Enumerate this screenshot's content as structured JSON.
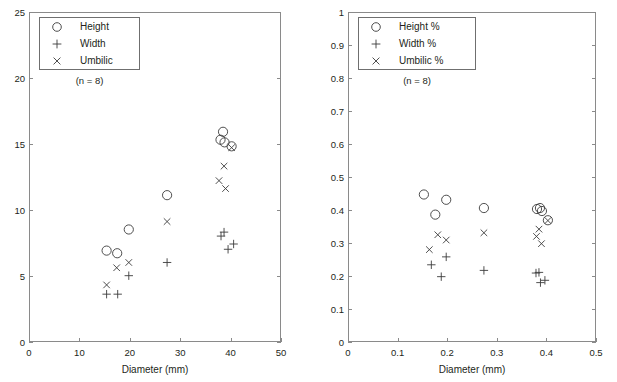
{
  "figure": {
    "background": "#ffffff",
    "axis_color": "#8a8a8a",
    "marker_color": "#3b3b3b",
    "text_color": "#231f20"
  },
  "panels": [
    {
      "id": "absolute",
      "legend": {
        "entries": [
          {
            "symbol": "circle-marker",
            "label": "Height"
          },
          {
            "symbol": "plus-marker",
            "label": "Width"
          },
          {
            "symbol": "cross-marker",
            "label": "Umbilic"
          }
        ],
        "note": "(n = 8)"
      }
    },
    {
      "id": "ratio",
      "legend": {
        "entries": [
          {
            "symbol": "circle-marker",
            "label": "Height %"
          },
          {
            "symbol": "plus-marker",
            "label": "Width %"
          },
          {
            "symbol": "cross-marker",
            "label": "Umbilic %"
          }
        ],
        "note": "(n = 8)"
      }
    }
  ],
  "chart_data": [
    {
      "type": "scatter",
      "title": "",
      "xlabel": "Diameter (mm)",
      "ylabel": "",
      "xlim": [
        0,
        50
      ],
      "ylim": [
        0,
        25
      ],
      "xticks": [
        0,
        10,
        20,
        30,
        40,
        50
      ],
      "yticks": [
        0,
        5,
        10,
        15,
        20,
        25
      ],
      "xtick_labels": [
        "0",
        "10",
        "20",
        "30",
        "40",
        "50"
      ],
      "ytick_labels": [
        "0",
        "5",
        "10",
        "15",
        "20",
        "25"
      ],
      "grid": false,
      "legend_position": "upper-left",
      "annotations": [
        "(n = 8)"
      ],
      "series": [
        {
          "name": "Height",
          "marker": "circle",
          "points": [
            [
              15.2,
              7.0
            ],
            [
              17.3,
              6.8
            ],
            [
              19.6,
              8.6
            ],
            [
              27.2,
              11.2
            ],
            [
              37.8,
              15.4
            ],
            [
              38.3,
              16.0
            ],
            [
              38.6,
              15.2
            ],
            [
              40.0,
              14.9
            ]
          ]
        },
        {
          "name": "Width",
          "marker": "plus",
          "points": [
            [
              15.2,
              3.7
            ],
            [
              17.4,
              3.7
            ],
            [
              19.6,
              5.1
            ],
            [
              27.2,
              6.1
            ],
            [
              37.9,
              8.1
            ],
            [
              38.5,
              8.4
            ],
            [
              39.3,
              7.1
            ],
            [
              40.4,
              7.5
            ]
          ]
        },
        {
          "name": "Umbilic",
          "marker": "cross",
          "points": [
            [
              15.2,
              4.4
            ],
            [
              17.2,
              5.7
            ],
            [
              19.6,
              6.1
            ],
            [
              27.2,
              9.2
            ],
            [
              37.5,
              12.3
            ],
            [
              38.5,
              13.4
            ],
            [
              38.8,
              11.7
            ],
            [
              40.0,
              14.8
            ]
          ]
        }
      ]
    },
    {
      "type": "scatter",
      "title": "",
      "xlabel": "Diameter (mm)",
      "ylabel": "",
      "xlim": [
        0,
        50
      ],
      "ylim": [
        0,
        1
      ],
      "xticks": [
        0,
        10,
        20,
        30,
        40,
        50
      ],
      "yticks": [
        0,
        0.1,
        0.2,
        0.3,
        0.4,
        0.5,
        0.6,
        0.7,
        0.8,
        0.9,
        1
      ],
      "xtick_labels": [
        "0",
        "0.1",
        "0.2",
        "0.3",
        "0.4",
        "0.5",
        "0.6",
        "0.7",
        "0.8",
        "0.9",
        "1"
      ],
      "ytick_labels": [
        "0",
        "0.1",
        "0.2",
        "0.3",
        "0.4",
        "0.5",
        "0.6",
        "0.7",
        "0.8",
        "0.9",
        "1"
      ],
      "grid": false,
      "legend_position": "upper-left",
      "annotations": [
        "(n = 8)"
      ],
      "series": [
        {
          "name": "Height %",
          "marker": "circle",
          "points": [
            [
              15.1,
              0.45
            ],
            [
              17.4,
              0.389
            ],
            [
              19.6,
              0.434
            ],
            [
              27.2,
              0.409
            ],
            [
              37.9,
              0.406
            ],
            [
              38.5,
              0.409
            ],
            [
              38.9,
              0.4
            ],
            [
              40.1,
              0.372
            ]
          ]
        },
        {
          "name": "Width %",
          "marker": "plus",
          "points": [
            [
              16.6,
              0.237
            ],
            [
              18.6,
              0.201
            ],
            [
              19.6,
              0.261
            ],
            [
              27.2,
              0.22
            ],
            [
              37.7,
              0.212
            ],
            [
              38.3,
              0.214
            ],
            [
              38.6,
              0.183
            ],
            [
              39.5,
              0.19
            ]
          ]
        },
        {
          "name": "Umbilic %",
          "marker": "cross",
          "points": [
            [
              16.2,
              0.283
            ],
            [
              17.9,
              0.328
            ],
            [
              19.6,
              0.312
            ],
            [
              27.2,
              0.334
            ],
            [
              37.8,
              0.323
            ],
            [
              38.3,
              0.345
            ],
            [
              38.8,
              0.301
            ],
            [
              40.1,
              0.371
            ]
          ]
        }
      ]
    }
  ]
}
